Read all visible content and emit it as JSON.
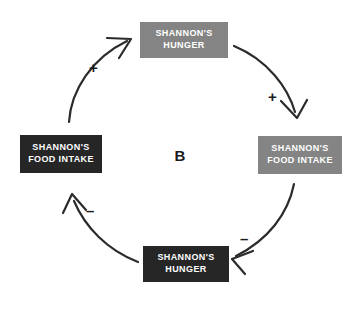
{
  "diagram": {
    "center_label": "B",
    "colors": {
      "gray_node": "#848484",
      "dark_node": "#262626",
      "node_text": "#ffffff",
      "arrow": "#2b2b2b",
      "background": "#ffffff",
      "label_text": "#1b1b1b"
    },
    "nodes": [
      {
        "id": "top",
        "label": "SHANNON'S\nHUNGER",
        "style": "gray"
      },
      {
        "id": "right",
        "label": "SHANNON'S\nFOOD INTAKE",
        "style": "gray"
      },
      {
        "id": "bottom",
        "label": "SHANNON'S\nHUNGER",
        "style": "dark"
      },
      {
        "id": "left",
        "label": "SHANNON'S\nFOOD INTAKE",
        "style": "dark"
      }
    ],
    "arrows": [
      {
        "id": "left-to-top",
        "from": "left",
        "to": "top",
        "sign": "+"
      },
      {
        "id": "top-to-right",
        "from": "top",
        "to": "right",
        "sign": "+"
      },
      {
        "id": "right-to-bottom",
        "from": "right",
        "to": "bottom",
        "sign": "–"
      },
      {
        "id": "bottom-to-left",
        "from": "bottom",
        "to": "left",
        "sign": "–"
      }
    ]
  }
}
